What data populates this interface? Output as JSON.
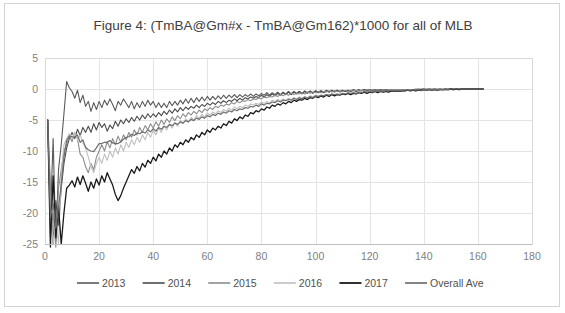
{
  "chart_data": {
    "type": "line",
    "title": "Figure 4: (TmBA@Gm#x - TmBA@Gm162)*1000 for all of MLB",
    "xlabel": "",
    "ylabel": "",
    "xlim": [
      0,
      180
    ],
    "ylim": [
      -25,
      5
    ],
    "xticks": [
      0,
      20,
      40,
      60,
      80,
      100,
      120,
      140,
      160,
      180
    ],
    "yticks": [
      5,
      0,
      -5,
      -10,
      -15,
      -20,
      -25
    ],
    "grid": true,
    "legend_position": "bottom",
    "x_start": 1,
    "x_end": 162,
    "series": [
      {
        "name": "2013",
        "color": "#595959",
        "width": 1.1,
        "values": [
          -5.0,
          -21.0,
          -8.0,
          -24.5,
          -13.0,
          -9.0,
          -4.0,
          1.2,
          0.2,
          -0.4,
          -1.5,
          -0.2,
          -2.2,
          -1.0,
          -2.8,
          -2.0,
          -3.6,
          -2.2,
          -3.3,
          -2.0,
          -3.0,
          -1.8,
          -2.6,
          -1.6,
          -2.5,
          -3.5,
          -2.0,
          -2.6,
          -1.6,
          -2.3,
          -3.0,
          -2.0,
          -3.2,
          -2.2,
          -3.0,
          -2.0,
          -2.8,
          -1.8,
          -2.6,
          -2.0,
          -3.0,
          -2.2,
          -3.0,
          -2.3,
          -3.0,
          -2.0,
          -2.7,
          -2.0,
          -2.6,
          -1.8,
          -2.4,
          -1.6,
          -2.3,
          -1.5,
          -2.2,
          -1.4,
          -2.0,
          -1.3,
          -1.9,
          -1.2,
          -1.8,
          -1.2,
          -1.7,
          -1.1,
          -1.6,
          -1.0,
          -1.5,
          -1.0,
          -1.4,
          -0.9,
          -1.4,
          -0.9,
          -1.3,
          -0.9,
          -1.2,
          -0.8,
          -1.2,
          -0.8,
          -1.1,
          -0.7,
          -1.0,
          -0.6,
          -1.0,
          -0.6,
          -0.9,
          -0.5,
          -0.9,
          -0.5,
          -0.8,
          -0.4,
          -0.8,
          -0.4,
          -0.7,
          -0.4,
          -0.7,
          -0.3,
          -0.6,
          -0.3,
          -0.6,
          -0.3,
          -0.5,
          -0.3,
          -0.5,
          -0.2,
          -0.5,
          -0.2,
          -0.4,
          -0.2,
          -0.4,
          -0.2,
          -0.4,
          -0.2,
          -0.3,
          -0.1,
          -0.3,
          -0.1,
          -0.3,
          -0.1,
          -0.3,
          -0.1,
          -0.3,
          -0.1,
          -0.2,
          -0.1,
          -0.2,
          -0.1,
          -0.2,
          -0.1,
          -0.2,
          -0.1,
          -0.2,
          -0.1,
          -0.2,
          -0.1,
          -0.2,
          -0.1,
          -0.1,
          -0.1,
          -0.1,
          0.0,
          -0.1,
          0.0,
          -0.1,
          0.0,
          -0.1,
          0.0,
          -0.1,
          0.0,
          -0.1,
          0.0,
          -0.1,
          0.0,
          0.0,
          0.0,
          0.0,
          0.0,
          0.0,
          0.0,
          0.0,
          0.0,
          0.0,
          0.0
        ]
      },
      {
        "name": "2014",
        "color": "#4a4a4a",
        "width": 1.1,
        "values": [
          -5.0,
          -16.0,
          -25.0,
          -18.0,
          -22.0,
          -16.0,
          -12.0,
          -9.5,
          -8.0,
          -7.0,
          -8.0,
          -6.5,
          -7.5,
          -6.2,
          -7.0,
          -6.0,
          -7.0,
          -5.6,
          -6.6,
          -5.4,
          -6.2,
          -5.6,
          -6.8,
          -5.8,
          -6.4,
          -5.2,
          -6.0,
          -5.0,
          -5.6,
          -4.8,
          -5.4,
          -4.6,
          -5.2,
          -4.4,
          -5.0,
          -4.2,
          -4.8,
          -4.0,
          -4.6,
          -4.0,
          -4.5,
          -3.8,
          -4.3,
          -3.6,
          -4.1,
          -3.4,
          -3.9,
          -3.2,
          -3.7,
          -3.0,
          -3.5,
          -2.9,
          -3.3,
          -2.8,
          -3.1,
          -2.6,
          -3.0,
          -2.5,
          -2.8,
          -2.3,
          -2.6,
          -2.2,
          -2.5,
          -2.0,
          -2.3,
          -1.9,
          -2.2,
          -1.8,
          -2.0,
          -1.6,
          -1.9,
          -1.5,
          -1.8,
          -1.4,
          -1.6,
          -1.3,
          -1.5,
          -1.2,
          -1.4,
          -1.0,
          -1.3,
          -0.9,
          -1.2,
          -0.8,
          -1.1,
          -0.7,
          -1.0,
          -0.6,
          -0.9,
          -0.5,
          -0.9,
          -0.5,
          -0.8,
          -0.4,
          -0.8,
          -0.4,
          -0.7,
          -0.4,
          -0.7,
          -0.3,
          -0.6,
          -0.3,
          -0.6,
          -0.3,
          -0.5,
          -0.3,
          -0.5,
          -0.2,
          -0.5,
          -0.2,
          -0.4,
          -0.2,
          -0.4,
          -0.2,
          -0.4,
          -0.2,
          -0.3,
          -0.1,
          -0.3,
          -0.1,
          -0.3,
          -0.1,
          -0.3,
          -0.1,
          -0.2,
          -0.1,
          -0.2,
          -0.1,
          -0.2,
          -0.1,
          -0.2,
          -0.1,
          -0.2,
          -0.1,
          -0.2,
          -0.1,
          -0.1,
          0.0,
          -0.1,
          0.0,
          -0.1,
          0.0,
          -0.1,
          0.0,
          -0.1,
          0.0,
          -0.1,
          0.0,
          0.0,
          0.0,
          0.0,
          0.0,
          0.0,
          0.0,
          0.0,
          0.0,
          0.0,
          0.0,
          0.0,
          0.0,
          0.0,
          0.0
        ]
      },
      {
        "name": "2015",
        "color": "#8c8c8c",
        "width": 1.1,
        "values": [
          -5.0,
          -24.0,
          -20.0,
          -25.5,
          -16.0,
          -13.0,
          -10.0,
          -9.0,
          -7.5,
          -8.5,
          -7.0,
          -8.0,
          -10.5,
          -11.0,
          -12.5,
          -13.5,
          -12.0,
          -13.0,
          -11.0,
          -10.0,
          -9.0,
          -10.0,
          -8.5,
          -9.5,
          -8.0,
          -9.0,
          -7.6,
          -8.6,
          -7.4,
          -8.2,
          -7.0,
          -7.8,
          -6.6,
          -7.4,
          -6.2,
          -7.0,
          -5.9,
          -6.6,
          -5.6,
          -6.3,
          -5.3,
          -6.0,
          -5.0,
          -5.7,
          -4.8,
          -5.4,
          -4.5,
          -5.1,
          -4.3,
          -4.8,
          -4.0,
          -4.5,
          -3.8,
          -4.2,
          -3.6,
          -4.0,
          -3.4,
          -3.8,
          -3.2,
          -3.5,
          -3.0,
          -3.3,
          -2.8,
          -3.0,
          -2.6,
          -2.8,
          -2.4,
          -2.6,
          -2.2,
          -2.4,
          -2.0,
          -2.2,
          -1.9,
          -2.0,
          -1.7,
          -1.9,
          -1.6,
          -1.7,
          -1.4,
          -1.6,
          -1.3,
          -1.4,
          -1.2,
          -1.3,
          -1.0,
          -1.2,
          -0.9,
          -1.1,
          -0.8,
          -1.0,
          -0.7,
          -0.9,
          -0.7,
          -0.8,
          -0.6,
          -0.8,
          -0.5,
          -0.7,
          -0.5,
          -0.6,
          -0.4,
          -0.6,
          -0.4,
          -0.5,
          -0.3,
          -0.5,
          -0.3,
          -0.4,
          -0.3,
          -0.4,
          -0.2,
          -0.4,
          -0.2,
          -0.3,
          -0.2,
          -0.3,
          -0.2,
          -0.3,
          -0.1,
          -0.2,
          -0.1,
          -0.2,
          -0.1,
          -0.2,
          -0.1,
          -0.2,
          -0.1,
          -0.1,
          -0.1,
          -0.1,
          -0.1,
          -0.1,
          -0.1,
          -0.1,
          -0.1,
          -0.1,
          0.0,
          -0.1,
          0.0,
          0.0,
          0.0,
          0.0,
          0.0,
          0.0,
          0.0,
          0.0,
          0.0,
          0.0,
          0.0,
          0.0,
          0.0,
          0.0,
          0.0,
          0.0,
          0.0,
          0.0,
          0.0,
          0.0,
          0.0,
          0.0,
          0.0,
          0.0
        ]
      },
      {
        "name": "2016",
        "color": "#bfbfbf",
        "width": 1.1,
        "values": [
          -5.0,
          -18.0,
          -25.0,
          -21.0,
          -25.0,
          -14.0,
          -9.0,
          -8.0,
          -7.2,
          -8.0,
          -7.0,
          -8.2,
          -7.4,
          -8.6,
          -9.5,
          -11.0,
          -12.5,
          -13.5,
          -12.0,
          -11.0,
          -12.0,
          -10.5,
          -11.5,
          -10.0,
          -11.0,
          -9.5,
          -10.5,
          -9.0,
          -10.0,
          -8.6,
          -9.4,
          -8.2,
          -9.0,
          -7.8,
          -8.6,
          -7.4,
          -8.2,
          -7.0,
          -7.8,
          -6.6,
          -7.4,
          -6.3,
          -7.0,
          -6.0,
          -6.6,
          -5.7,
          -6.3,
          -5.4,
          -6.0,
          -5.1,
          -5.6,
          -4.8,
          -5.3,
          -4.6,
          -5.0,
          -4.3,
          -4.7,
          -4.1,
          -4.5,
          -3.9,
          -4.2,
          -3.7,
          -4.0,
          -3.5,
          -3.8,
          -3.3,
          -3.6,
          -3.1,
          -3.4,
          -2.9,
          -3.2,
          -2.8,
          -3.0,
          -2.6,
          -2.8,
          -2.4,
          -2.6,
          -2.3,
          -2.5,
          -2.1,
          -2.3,
          -2.0,
          -2.2,
          -1.8,
          -2.0,
          -1.7,
          -1.9,
          -1.6,
          -1.8,
          -1.5,
          -1.7,
          -1.4,
          -1.6,
          -1.3,
          -1.5,
          -1.2,
          -1.4,
          -1.1,
          -1.3,
          -1.0,
          -1.2,
          -1.0,
          -1.1,
          -0.9,
          -1.1,
          -0.8,
          -1.0,
          -0.8,
          -0.9,
          -0.7,
          -0.9,
          -0.7,
          -0.8,
          -0.6,
          -0.8,
          -0.6,
          -0.7,
          -0.5,
          -0.7,
          -0.5,
          -0.6,
          -0.4,
          -0.6,
          -0.4,
          -0.5,
          -0.4,
          -0.5,
          -0.3,
          -0.4,
          -0.3,
          -0.4,
          -0.3,
          -0.4,
          -0.2,
          -0.3,
          -0.2,
          -0.3,
          -0.2,
          -0.3,
          -0.2,
          -0.2,
          -0.1,
          -0.2,
          -0.1,
          -0.2,
          -0.1,
          -0.1,
          -0.1,
          -0.1,
          -0.1,
          -0.1,
          0.0,
          -0.1,
          0.0,
          0.0,
          0.0,
          0.0,
          0.0,
          0.0,
          0.0,
          0.0,
          0.0
        ]
      },
      {
        "name": "2017",
        "color": "#1a1a1a",
        "width": 1.3,
        "values": [
          -5.0,
          -25.5,
          -14.0,
          -24.0,
          -19.0,
          -25.0,
          -20.0,
          -16.0,
          -15.5,
          -14.8,
          -15.8,
          -14.2,
          -15.4,
          -14.0,
          -15.2,
          -16.5,
          -15.0,
          -16.0,
          -14.5,
          -15.5,
          -14.0,
          -15.0,
          -13.5,
          -14.5,
          -15.5,
          -17.0,
          -18.0,
          -17.2,
          -16.0,
          -15.0,
          -14.0,
          -13.0,
          -13.6,
          -12.5,
          -13.2,
          -12.0,
          -12.6,
          -11.5,
          -12.0,
          -11.0,
          -11.6,
          -10.5,
          -11.0,
          -10.0,
          -10.5,
          -9.5,
          -10.0,
          -9.0,
          -9.4,
          -8.6,
          -9.0,
          -8.2,
          -8.6,
          -7.8,
          -8.2,
          -7.4,
          -7.8,
          -7.0,
          -7.4,
          -6.6,
          -7.0,
          -6.3,
          -6.6,
          -6.0,
          -6.3,
          -5.6,
          -5.9,
          -5.2,
          -5.5,
          -4.8,
          -5.1,
          -4.5,
          -4.8,
          -4.2,
          -4.4,
          -3.8,
          -4.0,
          -3.5,
          -3.7,
          -3.2,
          -3.4,
          -2.9,
          -3.1,
          -2.6,
          -2.8,
          -2.4,
          -2.6,
          -2.2,
          -2.4,
          -2.0,
          -2.2,
          -1.8,
          -2.0,
          -1.7,
          -1.8,
          -1.5,
          -1.7,
          -1.4,
          -1.5,
          -1.2,
          -1.4,
          -1.1,
          -1.3,
          -1.0,
          -1.2,
          -0.9,
          -1.1,
          -0.9,
          -1.0,
          -0.8,
          -0.9,
          -0.7,
          -0.9,
          -0.7,
          -0.8,
          -0.6,
          -0.7,
          -0.5,
          -0.7,
          -0.5,
          -0.6,
          -0.4,
          -0.6,
          -0.4,
          -0.5,
          -0.4,
          -0.5,
          -0.3,
          -0.4,
          -0.3,
          -0.4,
          -0.3,
          -0.3,
          -0.2,
          -0.3,
          -0.2,
          -0.3,
          -0.2,
          -0.2,
          -0.1,
          -0.2,
          -0.1,
          -0.2,
          -0.1,
          -0.2,
          -0.1,
          -0.1,
          -0.1,
          -0.1,
          0.0,
          -0.1,
          0.0,
          -0.1,
          0.0,
          0.0,
          0.0,
          0.0,
          0.0,
          0.0,
          0.0,
          0.0,
          0.0
        ]
      },
      {
        "name": "Overall Ave",
        "color": "#6e6e6e",
        "width": 1.2,
        "values": [
          -5.0,
          -20.8,
          -18.4,
          -22.5,
          -19.0,
          -15.4,
          -11.0,
          -8.3,
          -7.6,
          -7.7,
          -7.8,
          -7.4,
          -8.6,
          -8.2,
          -9.4,
          -9.8,
          -10.0,
          -10.1,
          -9.5,
          -8.8,
          -8.8,
          -8.6,
          -8.6,
          -8.3,
          -8.7,
          -8.8,
          -8.8,
          -8.5,
          -8.1,
          -7.8,
          -7.7,
          -7.3,
          -7.5,
          -7.1,
          -7.2,
          -6.9,
          -7.1,
          -6.6,
          -6.9,
          -6.4,
          -6.8,
          -6.2,
          -6.5,
          -6.0,
          -6.2,
          -5.7,
          -5.9,
          -5.5,
          -5.7,
          -5.3,
          -5.5,
          -5.1,
          -5.3,
          -4.9,
          -5.1,
          -4.7,
          -4.9,
          -4.5,
          -4.7,
          -4.3,
          -4.5,
          -4.1,
          -4.3,
          -3.9,
          -4.1,
          -3.7,
          -3.9,
          -3.5,
          -3.7,
          -3.3,
          -3.5,
          -3.2,
          -3.3,
          -3.0,
          -3.1,
          -2.8,
          -2.9,
          -2.6,
          -2.8,
          -2.4,
          -2.6,
          -2.3,
          -2.4,
          -2.1,
          -2.2,
          -1.9,
          -2.1,
          -1.8,
          -1.9,
          -1.7,
          -1.8,
          -1.5,
          -1.7,
          -1.4,
          -1.6,
          -1.3,
          -1.5,
          -1.2,
          -1.4,
          -1.1,
          -1.2,
          -1.0,
          -1.1,
          -0.9,
          -1.0,
          -0.8,
          -0.9,
          -0.8,
          -0.9,
          -0.7,
          -0.8,
          -0.6,
          -0.7,
          -0.6,
          -0.7,
          -0.5,
          -0.6,
          -0.4,
          -0.5,
          -0.4,
          -0.5,
          -0.3,
          -0.4,
          -0.3,
          -0.4,
          -0.3,
          -0.3,
          -0.2,
          -0.3,
          -0.2,
          -0.3,
          -0.2,
          -0.2,
          -0.2,
          -0.2,
          -0.1,
          -0.2,
          -0.1,
          -0.2,
          -0.1,
          -0.1,
          -0.1,
          -0.1,
          -0.1,
          -0.1,
          -0.1,
          -0.1,
          0.0,
          -0.1,
          0.0,
          0.0,
          0.0,
          0.0,
          0.0,
          0.0,
          0.0,
          0.0,
          0.0,
          0.0,
          0.0,
          0.0,
          0.0
        ]
      }
    ]
  }
}
